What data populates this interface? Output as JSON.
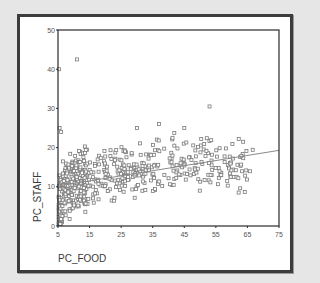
{
  "chart_data": {
    "type": "scatter",
    "title": "",
    "xlabel": "PC_FOOD",
    "ylabel": "PC_STAFF",
    "xlim": [
      5,
      75
    ],
    "ylim": [
      0,
      50
    ],
    "xticks": [
      5,
      15,
      25,
      35,
      45,
      55,
      65,
      75
    ],
    "yticks": [
      0,
      10,
      20,
      30,
      40,
      50
    ],
    "grid": false,
    "legend": null,
    "marker": "open-square",
    "marker_color": "#7a7a7a",
    "fit_line": {
      "type": "linear",
      "x": [
        5,
        75
      ],
      "y": [
        10.2,
        19.3
      ],
      "color": "#8a8a8a"
    },
    "outliers": [
      {
        "x": 5.3,
        "y": 40,
        "label": ""
      },
      {
        "x": 11,
        "y": 42.5
      },
      {
        "x": 5.5,
        "y": 25
      },
      {
        "x": 6,
        "y": 24
      },
      {
        "x": 53,
        "y": 30.5
      },
      {
        "x": 37,
        "y": 26
      },
      {
        "x": 45,
        "y": 25
      },
      {
        "x": 30,
        "y": 25
      }
    ],
    "series": [
      {
        "name": "PC_STAFF vs PC_FOOD",
        "cluster_description": "Dense cluster at low PC_FOOD (5-15) with PC_STAFF 2-18, spreading rightwards with positive trend to PC_FOOD ~65",
        "seed_points": [
          [
            5,
            2
          ],
          [
            5.5,
            4
          ],
          [
            6,
            7
          ],
          [
            6.5,
            9
          ],
          [
            7,
            11
          ],
          [
            7.5,
            13
          ],
          [
            8,
            6
          ],
          [
            8.5,
            10
          ],
          [
            9,
            12
          ],
          [
            9.5,
            8
          ],
          [
            10,
            14
          ],
          [
            10.5,
            11
          ],
          [
            11,
            9
          ],
          [
            11.5,
            13
          ],
          [
            12,
            15
          ],
          [
            12.5,
            7
          ],
          [
            13,
            12
          ],
          [
            13.5,
            10
          ],
          [
            14,
            16
          ],
          [
            15,
            11
          ],
          [
            16,
            13
          ],
          [
            17,
            9
          ],
          [
            18,
            14
          ],
          [
            19,
            12
          ],
          [
            20,
            16
          ],
          [
            21,
            10
          ],
          [
            22,
            13
          ],
          [
            23,
            15
          ],
          [
            24,
            11
          ],
          [
            25,
            17
          ],
          [
            26,
            14
          ],
          [
            27,
            12
          ],
          [
            28,
            16
          ],
          [
            29,
            13
          ],
          [
            30,
            18
          ],
          [
            31,
            11
          ],
          [
            32,
            15
          ],
          [
            33,
            14
          ],
          [
            34,
            17
          ],
          [
            35,
            13
          ],
          [
            36,
            16
          ],
          [
            37,
            12
          ],
          [
            38,
            19
          ],
          [
            39,
            15
          ],
          [
            40,
            14
          ],
          [
            41,
            17
          ],
          [
            42,
            13
          ],
          [
            43,
            20
          ],
          [
            44,
            16
          ],
          [
            45,
            12
          ],
          [
            46,
            18
          ],
          [
            47,
            15
          ],
          [
            48,
            14
          ],
          [
            49,
            17
          ],
          [
            50,
            20
          ],
          [
            51,
            13
          ],
          [
            52,
            16
          ],
          [
            53,
            15
          ],
          [
            54,
            19
          ],
          [
            55,
            14
          ],
          [
            56,
            17
          ],
          [
            57,
            12
          ],
          [
            58,
            16
          ],
          [
            59,
            18
          ],
          [
            60,
            15
          ],
          [
            61,
            13
          ],
          [
            62,
            19
          ],
          [
            63,
            14
          ],
          [
            64,
            12
          ],
          [
            65,
            17
          ]
        ]
      }
    ]
  }
}
